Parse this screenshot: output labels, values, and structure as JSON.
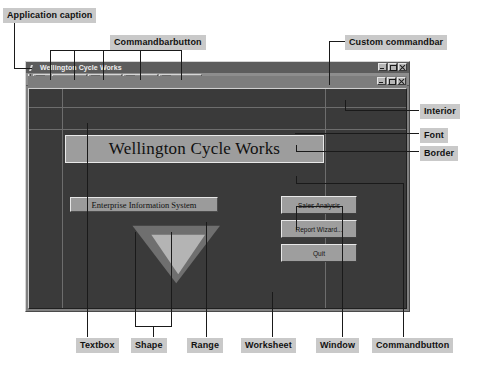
{
  "annotations": {
    "application_caption": "Application caption",
    "commandbarbutton": "Commandbarbutton",
    "custom_commandbar": "Custom commandbar",
    "interior": "Interior",
    "font": "Font",
    "border": "Border",
    "textbox": "Textbox",
    "shape": "Shape",
    "range": "Range",
    "worksheet": "Worksheet",
    "window": "Window",
    "commandbutton": "Commandbutton"
  },
  "app_window": {
    "title": "Wellington Cycle Works",
    "title_icon": "excel-icon",
    "window_buttons": [
      {
        "name": "minimize-button",
        "glyph": "minimize-icon"
      },
      {
        "name": "maximize-button",
        "glyph": "maximize-icon"
      },
      {
        "name": "close-button",
        "glyph": "close-icon"
      }
    ],
    "child_window_buttons": [
      {
        "name": "child-minimize-button",
        "glyph": "minimize-icon"
      },
      {
        "name": "child-restore-button",
        "glyph": "restore-icon"
      },
      {
        "name": "child-close-button",
        "glyph": "close-icon"
      }
    ]
  },
  "commandbar": {
    "grip": "commandbar-grip",
    "buttons": [
      {
        "label": "",
        "icon": "excel-logo-icon"
      },
      {
        "label": "Home",
        "icon": "back-arrow-icon"
      },
      {
        "label": "Pivot",
        "icon": "pivot-table-icon"
      },
      {
        "label": "Chart",
        "icon": "bar-chart-icon"
      },
      {
        "label": "Reports",
        "icon": "columns-icon"
      },
      {
        "label": "EditApp!",
        "icon": ""
      }
    ]
  },
  "worksheet": {
    "banner_text": "Wellington Cycle Works",
    "textbox_text": "Enterprise Information System",
    "buttons": [
      {
        "label": "Sales Analysis"
      },
      {
        "label": "Report Wizard..."
      },
      {
        "label": "Quit"
      }
    ],
    "shapes": [
      {
        "name": "large-triangle",
        "fill": "#6f6f6f"
      },
      {
        "name": "small-triangle",
        "fill": "#b4b4b4"
      }
    ]
  },
  "colors": {
    "callout_bg": "#c9c9c9",
    "leader_line": "#1a1a1a",
    "window_face": "#808080",
    "worksheet_interior": "#3a3a3a",
    "titlebar": "#5c5c5c",
    "commandbar": "#8d8d8d",
    "banner_face": "#9d9d9d",
    "button_face": "#9e9e9e"
  }
}
